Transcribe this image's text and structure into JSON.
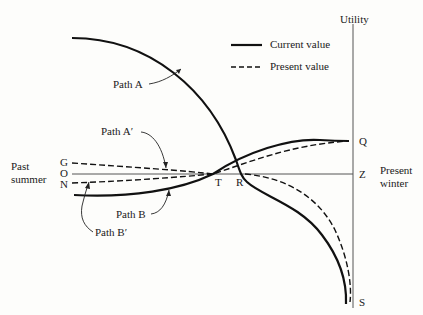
{
  "diagram": {
    "axis_label": "Utility",
    "legend": [
      {
        "style": "solid",
        "label": "Current value"
      },
      {
        "style": "dashed",
        "label": "Present value"
      }
    ],
    "left_label_line1": "Past",
    "left_label_line2": "summer",
    "right_label_line1": "Present",
    "right_label_line2": "winter",
    "points": {
      "G": "G",
      "O": "O",
      "N": "N",
      "T": "T",
      "R": "R",
      "Q": "Q",
      "Z": "Z",
      "S": "S"
    },
    "paths": {
      "A": "Path A",
      "A_prime": "Path A′",
      "B": "Path B",
      "B_prime": "Path B′"
    }
  }
}
